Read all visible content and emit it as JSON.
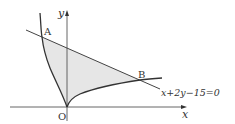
{
  "diagram": {
    "axes": {
      "x_label": "x",
      "y_label": "y",
      "origin_label": "O"
    },
    "points": [
      {
        "label": "A"
      },
      {
        "label": "B"
      }
    ],
    "line_equation": "x+2y−15=0",
    "colors": {
      "stroke": "#333333",
      "axis": "#555555",
      "shade": "#e6e6e6"
    }
  }
}
